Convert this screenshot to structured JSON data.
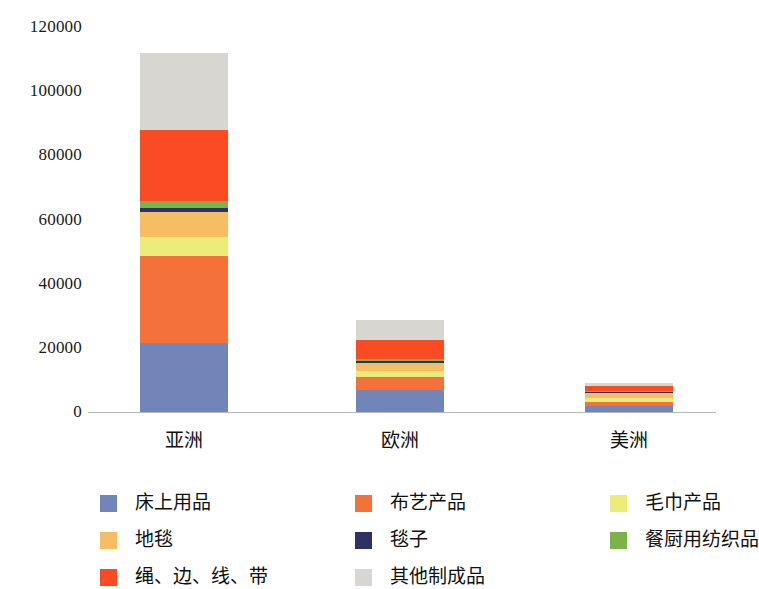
{
  "chart_data": {
    "type": "bar",
    "subtype": "stacked-vertical",
    "title": "",
    "xlabel": "",
    "ylabel": "",
    "ylim": [
      0,
      120000
    ],
    "ytick_step": 20000,
    "yticks": [
      "120000",
      "100000",
      "80000",
      "60000",
      "40000",
      "20000",
      "0"
    ],
    "ytick_values": [
      120000,
      100000,
      80000,
      60000,
      40000,
      20000,
      0
    ],
    "grid": false,
    "legend_position": "bottom",
    "categories": [
      "亚洲",
      "欧洲",
      "美洲"
    ],
    "series": [
      {
        "name": "床上用品",
        "color": "#7185b8",
        "values": [
          21500,
          6800,
          1900
        ]
      },
      {
        "name": "布艺产品",
        "color": "#f4713a",
        "values": [
          27000,
          4000,
          1200
        ]
      },
      {
        "name": "毛巾产品",
        "color": "#eced79",
        "values": [
          6200,
          2000,
          1400
        ]
      },
      {
        "name": "地毯",
        "color": "#f7bd63",
        "values": [
          7500,
          2600,
          1500
        ]
      },
      {
        "name": "毯子",
        "color": "#2f3164",
        "values": [
          1300,
          500,
          200
        ]
      },
      {
        "name": "餐厨用纺织品",
        "color": "#7cb24a",
        "values": [
          2300,
          600,
          300
        ]
      },
      {
        "name": "绳、边、线、带",
        "color": "#fa4b22",
        "values": [
          22200,
          5800,
          1600
        ]
      },
      {
        "name": "其他制成品",
        "color": "#d8d6d0",
        "values": [
          24000,
          6300,
          800
        ]
      }
    ],
    "totals": [
      112000,
      26000,
      8900
    ]
  },
  "legend": {
    "items": [
      {
        "label": "床上用品",
        "color": "#7185b8"
      },
      {
        "label": "布艺产品",
        "color": "#f4713a"
      },
      {
        "label": "毛巾产品",
        "color": "#eced79"
      },
      {
        "label": "地毯",
        "color": "#f7bd63"
      },
      {
        "label": "毯子",
        "color": "#2f3164"
      },
      {
        "label": "餐厨用纺织品",
        "color": "#7cb24a"
      },
      {
        "label": "绳、边、线、带",
        "color": "#fa4b22"
      },
      {
        "label": "其他制成品",
        "color": "#d8d6d0"
      }
    ]
  },
  "axis": {
    "baseline_color": "#b8b8b8"
  }
}
